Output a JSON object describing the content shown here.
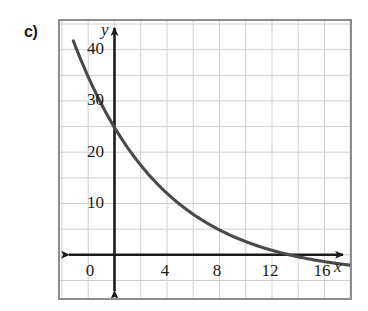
{
  "figure": {
    "part_label": "c)",
    "frame_color": "#8d8d8d",
    "grid_color": "#cfcfcf",
    "axis_color": "#1b1b1b",
    "curve_color": "#4a4a4a",
    "background": "#ffffff"
  },
  "axes": {
    "x_name": "x",
    "y_name": "y",
    "x_ticks": [
      {
        "label": "0",
        "value": 0
      },
      {
        "label": "4",
        "value": 4
      },
      {
        "label": "8",
        "value": 8
      },
      {
        "label": "12",
        "value": 12
      },
      {
        "label": "16",
        "value": 16
      }
    ],
    "y_ticks": [
      {
        "label": "10",
        "value": 10
      },
      {
        "label": "20",
        "value": 20
      },
      {
        "label": "30",
        "value": 30
      },
      {
        "label": "40",
        "value": 40
      }
    ]
  },
  "chart_data": {
    "type": "line",
    "title": "",
    "subtitle": "",
    "xlabel": "x",
    "ylabel": "y",
    "xlim": [
      -1.2,
      17.5
    ],
    "ylim": [
      -4,
      46
    ],
    "grid": true,
    "grid_spacing_x": 2,
    "grid_spacing_y": 5,
    "legend": null,
    "legend_position": "none",
    "annotations": [
      "c)"
    ],
    "series": [
      {
        "name": "exponential decay",
        "equation": "y = 40 * (1/2)^(x/4)",
        "x": [
          0,
          1,
          2,
          3,
          4,
          5,
          6,
          7,
          8,
          9,
          10,
          11,
          12,
          13,
          14,
          15,
          16,
          17
        ],
        "values": [
          40,
          33.6,
          28.3,
          23.8,
          20,
          16.8,
          14.1,
          11.9,
          10,
          8.4,
          7.1,
          5.9,
          5,
          4.2,
          3.5,
          3,
          2.5,
          2.1
        ],
        "key_points": [
          {
            "x": 0,
            "y": 40
          },
          {
            "x": 4,
            "y": 20
          },
          {
            "x": 8,
            "y": 10
          },
          {
            "x": 12,
            "y": 5
          },
          {
            "x": 16,
            "y": 2.5
          }
        ]
      }
    ]
  }
}
